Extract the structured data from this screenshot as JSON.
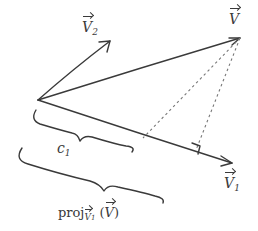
{
  "diagram": {
    "title": "",
    "style": "hand-drawn vector projection sketch",
    "colors": {
      "ink": "#3a3a3a",
      "dotted": "#777777",
      "background": "#ffffff"
    },
    "vectors": [
      {
        "id": "v2",
        "label_base": "V",
        "label_sub": "2",
        "from": [
          38,
          100
        ],
        "to": [
          110,
          41
        ]
      },
      {
        "id": "v",
        "label_base": "V",
        "label_sub": "",
        "from": [
          38,
          100
        ],
        "to": [
          240,
          38
        ]
      },
      {
        "id": "v1",
        "label_base": "V",
        "label_sub": "1",
        "from": [
          38,
          100
        ],
        "to": [
          232,
          163
        ]
      }
    ],
    "dotted_lines": [
      {
        "from": [
          240,
          38
        ],
        "to": [
          143,
          138
        ]
      },
      {
        "from": [
          240,
          38
        ],
        "to": [
          196,
          150
        ]
      }
    ],
    "right_angle_marker": {
      "at": [
        196,
        150
      ]
    },
    "braces": [
      {
        "id": "c1-brace",
        "label": "c",
        "label_sub": "1"
      },
      {
        "id": "proj-brace",
        "label": "proj",
        "label_sub": "v₁",
        "label_arg": "(v)"
      }
    ],
    "labels": {
      "v2": {
        "base": "V",
        "sub": "2"
      },
      "v": {
        "base": "V"
      },
      "v1": {
        "base": "V",
        "sub": "1"
      },
      "c1": {
        "base": "c",
        "sub": "1"
      },
      "proj": {
        "prefix": "proj",
        "sub_base": "V",
        "sub_index": "1",
        "open": " (",
        "arg": "V",
        "close": ")"
      }
    }
  }
}
